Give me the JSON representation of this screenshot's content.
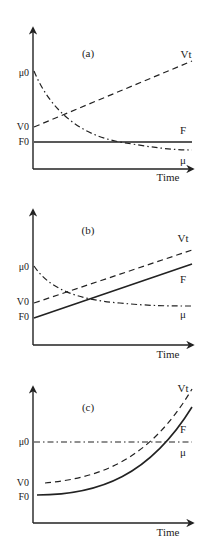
{
  "figure": {
    "width": 213,
    "height": 537,
    "line_color": "#222222",
    "panels": [
      {
        "id": "a",
        "label": "(a)",
        "label_pos": [
          88,
          57
        ],
        "axes": {
          "x0": 33,
          "y_top": 28,
          "y_axis": 169,
          "x_end": 193
        },
        "x_label": "Time",
        "x_label_pos": [
          168,
          181
        ],
        "y_ticks": [
          {
            "text": "μ0",
            "y": 76
          },
          {
            "text": "V0",
            "y": 130
          },
          {
            "text": "F0",
            "y": 145
          }
        ],
        "curves": [
          {
            "name": "Vt",
            "style": "dashed",
            "label": "Vt",
            "label_pos": [
              186,
              58
            ],
            "path": "M34,127 L192,61"
          },
          {
            "name": "F",
            "style": "solid",
            "label": "F",
            "label_pos": [
              183,
              134
            ],
            "path": "M34,142 L192,142"
          },
          {
            "name": "μ",
            "style": "dashdot",
            "label": "μ",
            "label_pos": [
              183,
              164
            ],
            "path": "M34,71 C50,110 80,135 120,142 C150,147 170,150 192,150"
          }
        ]
      },
      {
        "id": "b",
        "label": "(b)",
        "label_pos": [
          88,
          234
        ],
        "axes": {
          "x0": 33,
          "y_top": 210,
          "y_axis": 345,
          "x_end": 193
        },
        "x_label": "Time",
        "x_label_pos": [
          168,
          358
        ],
        "y_ticks": [
          {
            "text": "μ0",
            "y": 270
          },
          {
            "text": "V0",
            "y": 305
          },
          {
            "text": "F0",
            "y": 320
          }
        ],
        "curves": [
          {
            "name": "Vt",
            "style": "dashed",
            "label": "Vt",
            "label_pos": [
              183,
              242
            ],
            "path": "M34,303 L192,250"
          },
          {
            "name": "F",
            "style": "solid",
            "label": "F",
            "label_pos": [
              183,
              283
            ],
            "path": "M34,318 L192,264"
          },
          {
            "name": "μ",
            "style": "dashdot",
            "label": "μ",
            "label_pos": [
              183,
              318
            ],
            "path": "M34,266 C50,290 80,300 120,303 C150,306 170,306 192,306"
          }
        ]
      },
      {
        "id": "c",
        "label": "(c)",
        "label_pos": [
          88,
          411
        ],
        "axes": {
          "x0": 33,
          "y_top": 387,
          "y_axis": 523,
          "x_end": 193
        },
        "x_label": "Time",
        "x_label_pos": [
          168,
          536
        ],
        "y_ticks": [
          {
            "text": "μ0",
            "y": 445
          },
          {
            "text": "V0",
            "y": 486
          },
          {
            "text": "F0",
            "y": 500
          }
        ],
        "curves": [
          {
            "name": "Vt",
            "style": "dashed",
            "label": "Vt",
            "label_pos": [
              183,
              392
            ],
            "path": "M45,483 C100,478 150,460 192,389"
          },
          {
            "name": "F",
            "style": "solid",
            "label": "F",
            "label_pos": [
              183,
              433
            ],
            "path": "M37,495 C100,495 150,475 192,407"
          },
          {
            "name": "μ",
            "style": "dashdot",
            "label": "μ",
            "label_pos": [
              183,
              456
            ],
            "path": "M34,442 L192,442"
          }
        ]
      }
    ]
  }
}
